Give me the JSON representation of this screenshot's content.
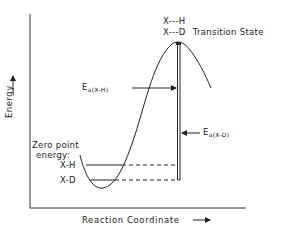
{
  "diagram": {
    "type": "reaction-energy-profile",
    "axes": {
      "x_label": "Reaction Coordinate",
      "x_arrow": "⟶",
      "y_label": "Energy",
      "y_arrow": "⟶"
    },
    "transition_state": {
      "line1": "X---H",
      "line2": "X---D",
      "label": "Transition State"
    },
    "activation_energies": {
      "xh": {
        "symbol": "E",
        "subscript": "a(X-H)"
      },
      "xd": {
        "symbol": "E",
        "subscript": "a(X-D)"
      }
    },
    "zero_point": {
      "title_line1": "Zero point",
      "title_line2": "energy:",
      "levels": [
        {
          "label": "X-H"
        },
        {
          "label": "X-D"
        }
      ]
    },
    "colors": {
      "ink": "#222222",
      "background": "#ffffff"
    }
  }
}
